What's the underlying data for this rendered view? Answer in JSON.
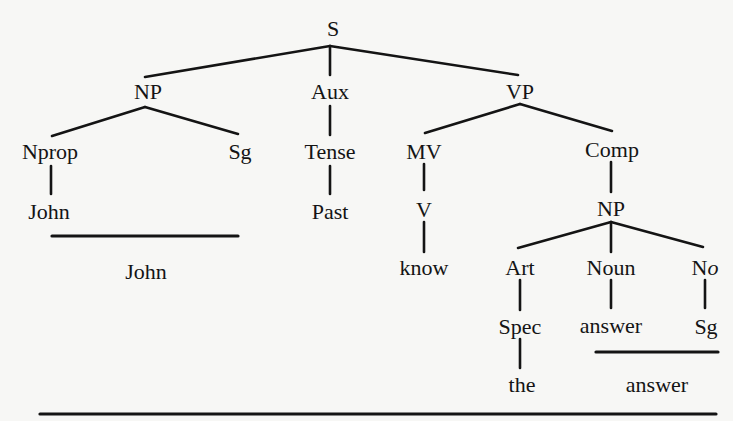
{
  "diagram": {
    "type": "phrase-structure-tree",
    "sentence": "John know the answer",
    "nodes": {
      "S": "S",
      "NP1": "NP",
      "Aux": "Aux",
      "VP": "VP",
      "Nprop": "Nprop",
      "Sg1": "Sg",
      "Tense": "Tense",
      "MV": "MV",
      "Comp": "Comp",
      "John_leaf": "John",
      "Past": "Past",
      "V": "V",
      "NP2": "NP",
      "know": "know",
      "Art": "Art",
      "Noun": "Noun",
      "No_N": "N",
      "No_o": "o",
      "Spec": "Spec",
      "answer_leaf": "answer",
      "Sg2": "Sg",
      "the": "the"
    },
    "derived": {
      "john": "John",
      "answer": "answer"
    },
    "edges": [
      [
        "S",
        "NP1"
      ],
      [
        "S",
        "Aux"
      ],
      [
        "S",
        "VP"
      ],
      [
        "NP1",
        "Nprop"
      ],
      [
        "NP1",
        "Sg1"
      ],
      [
        "Aux",
        "Tense"
      ],
      [
        "Tense",
        "Past"
      ],
      [
        "Nprop",
        "John_leaf"
      ],
      [
        "VP",
        "MV"
      ],
      [
        "VP",
        "Comp"
      ],
      [
        "MV",
        "V"
      ],
      [
        "V",
        "know"
      ],
      [
        "Comp",
        "NP2"
      ],
      [
        "NP2",
        "Art"
      ],
      [
        "NP2",
        "Noun"
      ],
      [
        "NP2",
        "No"
      ],
      [
        "Art",
        "Spec"
      ],
      [
        "Spec",
        "the"
      ],
      [
        "Noun",
        "answer_leaf"
      ],
      [
        "No",
        "Sg2"
      ]
    ]
  }
}
